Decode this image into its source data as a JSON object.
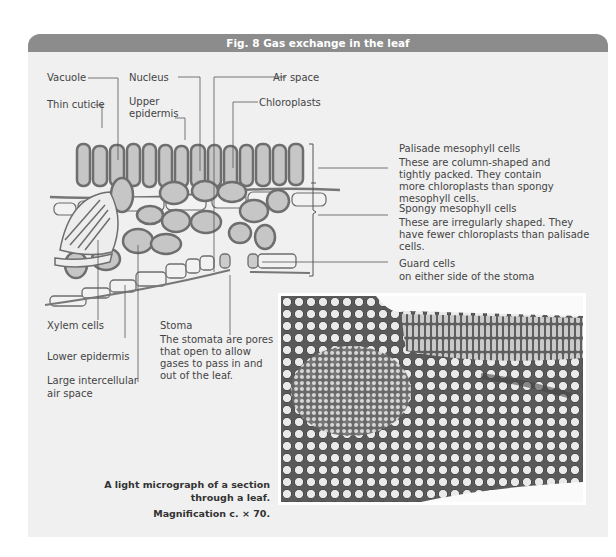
{
  "figure": {
    "title": "Fig. 8  Gas exchange in the leaf",
    "header_color": "#8c8c8c",
    "panel_color": "#f0f0f0"
  },
  "labels": {
    "vacuole": "Vacuole",
    "nucleus": "Nucleus",
    "air_space": "Air space",
    "thin_cuticle": "Thin cuticle",
    "upper_epidermis_1": "Upper",
    "upper_epidermis_2": "epidermis",
    "chloroplasts": "Chloroplasts",
    "xylem_cells": "Xylem cells",
    "lower_epidermis": "Lower epidermis",
    "large_air_space_1": "Large intercellular",
    "large_air_space_2": "air space",
    "stoma": "Stoma"
  },
  "annotations": {
    "palisade": {
      "title": "Palisade mesophyll cells",
      "text": "These are column-shaped and tightly packed. They contain more chloroplasts than spongy mesophyll cells."
    },
    "spongy": {
      "title": "Spongy mesophyll cells",
      "text": "These are irregularly shaped. They have fewer chloroplasts than palisade cells."
    },
    "guard": {
      "title": "Guard cells",
      "text": "on either side of the stoma"
    },
    "stoma_desc": "The stomata are pores that open to allow gases to pass in and out of the leaf."
  },
  "micrograph": {
    "caption_1": "A light micrograph of a section",
    "caption_2": "through a leaf.",
    "magnification": "Magnification c. × 70."
  }
}
